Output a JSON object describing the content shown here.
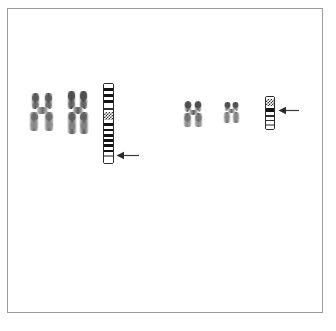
{
  "figure": {
    "title": "Chromosome ideogram and metaphase comparison panel",
    "background_color": "#ffffff",
    "frame_color": "#9a9a9a",
    "width": 336,
    "height": 331
  },
  "groups": [
    {
      "id": "left-group",
      "label": "Left chromosome pair with ideogram",
      "chromosomes": [
        {
          "id": "left-chromosome-1",
          "label": "Metaphase chromosome 1",
          "x": 28,
          "y": 90,
          "w": 30,
          "h": 42
        },
        {
          "id": "left-chromosome-2",
          "label": "Metaphase chromosome 2",
          "x": 65,
          "y": 89,
          "w": 28,
          "h": 46
        }
      ],
      "ideogram": {
        "id": "left-ideogram",
        "label": "G-banded ideogram, large chromosome",
        "x": 103,
        "y": 83,
        "width": 11,
        "height": 81,
        "bands": [
          {
            "name": "p-ter",
            "shade": "white",
            "height": 4
          },
          {
            "name": "p25",
            "shade": "black",
            "height": 4
          },
          {
            "name": "p24",
            "shade": "white",
            "height": 3
          },
          {
            "name": "p23",
            "shade": "black",
            "height": 4
          },
          {
            "name": "p22",
            "shade": "white",
            "height": 3
          },
          {
            "name": "p21",
            "shade": "black",
            "height": 4
          },
          {
            "name": "p13",
            "shade": "white",
            "height": 5
          },
          {
            "name": "p12",
            "shade": "dark",
            "height": 3
          },
          {
            "name": "p11",
            "shade": "white",
            "height": 2
          },
          {
            "name": "cen",
            "shade": "stipple",
            "height": 9
          },
          {
            "name": "q11",
            "shade": "white",
            "height": 3
          },
          {
            "name": "q12",
            "shade": "black",
            "height": 4
          },
          {
            "name": "q13",
            "shade": "white",
            "height": 3
          },
          {
            "name": "q21",
            "shade": "black",
            "height": 3
          },
          {
            "name": "q22",
            "shade": "white",
            "height": 3
          },
          {
            "name": "q23",
            "shade": "black",
            "height": 3
          },
          {
            "name": "q24",
            "shade": "white",
            "height": 3
          },
          {
            "name": "q25",
            "shade": "black",
            "height": 3
          },
          {
            "name": "q31",
            "shade": "white",
            "height": 3
          },
          {
            "name": "q32",
            "shade": "black",
            "height": 3
          },
          {
            "name": "q33",
            "shade": "white",
            "height": 3
          },
          {
            "name": "q34",
            "shade": "black",
            "height": 3
          },
          {
            "name": "q35",
            "shade": "white",
            "height": 3
          },
          {
            "name": "q36",
            "shade": "gray",
            "height": 2
          },
          {
            "name": "q37",
            "shade": "white",
            "height": 3
          },
          {
            "name": "q-ter",
            "shade": "white",
            "height": 4
          }
        ]
      },
      "arrow": {
        "id": "left-arrow",
        "label": "Arrow marking breakpoint on large ideogram",
        "direction": "left",
        "tip_x": 117,
        "tail_x": 138,
        "y": 155,
        "color": "#3a3a3a"
      }
    },
    {
      "id": "right-group",
      "label": "Right chromosome pair with ideogram",
      "chromosomes": [
        {
          "id": "right-chromosome-1",
          "label": "Metaphase chromosome 3",
          "x": 182,
          "y": 99,
          "w": 24,
          "h": 30
        },
        {
          "id": "right-chromosome-2",
          "label": "Metaphase chromosome 4",
          "x": 222,
          "y": 100,
          "w": 20,
          "h": 25
        }
      ],
      "ideogram": {
        "id": "right-ideogram",
        "label": "G-banded ideogram, small chromosome",
        "x": 265,
        "y": 96,
        "width": 10,
        "height": 34,
        "bands": [
          {
            "name": "p-ter",
            "shade": "white",
            "height": 2
          },
          {
            "name": "p13",
            "shade": "stipple",
            "height": 8
          },
          {
            "name": "p11",
            "shade": "white",
            "height": 2
          },
          {
            "name": "cen",
            "shade": "black",
            "height": 4
          },
          {
            "name": "q11",
            "shade": "white",
            "height": 3
          },
          {
            "name": "q12",
            "shade": "dark",
            "height": 2
          },
          {
            "name": "q13",
            "shade": "white",
            "height": 3
          },
          {
            "name": "q21",
            "shade": "dark",
            "height": 2
          },
          {
            "name": "q22",
            "shade": "white",
            "height": 3
          },
          {
            "name": "q23",
            "shade": "gray",
            "height": 2
          },
          {
            "name": "q-ter",
            "shade": "white",
            "height": 3
          }
        ]
      },
      "arrow": {
        "id": "right-arrow",
        "label": "Arrow marking breakpoint on small ideogram",
        "direction": "left",
        "tip_x": 279,
        "tail_x": 299,
        "y": 110,
        "color": "#3a3a3a"
      }
    }
  ]
}
